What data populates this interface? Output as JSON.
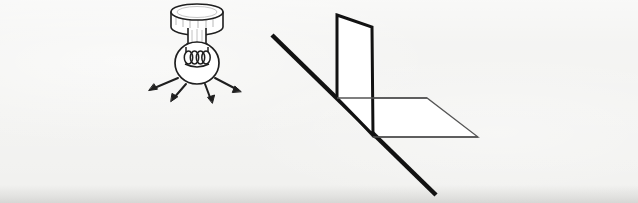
{
  "figure": {
    "title": "Light source and illuminated surfaces diagram",
    "background_color": "#f1f1ef",
    "ink_color": "#1a1a1a",
    "fill_color": "#ffffff",
    "width": 638,
    "height": 203
  },
  "lamp": {
    "label": "Ceiling-mounted light bulb emitting light rays",
    "ceiling_mount": {
      "label": "Ceiling canopy",
      "center_x": 197,
      "top_y": 12,
      "rx": 26,
      "ry": 8,
      "body_height": 15
    },
    "stem": {
      "label": "Lamp stem",
      "x": 188,
      "y": 30,
      "width": 18,
      "height": 18
    },
    "bulb": {
      "label": "Light bulb",
      "center_x": 197,
      "center_y": 63,
      "rx": 22,
      "ry": 21
    },
    "filament": {
      "label": "Coiled filament",
      "coil_count": 4,
      "center_x": 197,
      "center_y": 57
    },
    "rays": [
      {
        "name": "ray-upper-left",
        "x1": 178,
        "y1": 78,
        "x2": 150,
        "y2": 90
      },
      {
        "name": "ray-lower-left",
        "x1": 186,
        "y1": 84,
        "x2": 172,
        "y2": 101
      },
      {
        "name": "ray-lower-right",
        "x1": 205,
        "y1": 84,
        "x2": 212,
        "y2": 102
      },
      {
        "name": "ray-upper-right",
        "x1": 215,
        "y1": 78,
        "x2": 240,
        "y2": 92
      }
    ],
    "ray_count": 4
  },
  "geometry": {
    "label": "Perspective drawing of a vertical panel meeting a horizontal plane, crossed by a diagonal line",
    "wall": {
      "label": "Vertical panel",
      "points": "337,15 372,27 373,135 337,98",
      "stroke_width": 3
    },
    "floor": {
      "label": "Horizontal plane",
      "points": "337,98 427,98 478,137 373,137",
      "stroke_width": 1.3
    },
    "diagonal": {
      "label": "Thick diagonal line",
      "x1": 272,
      "y1": 35,
      "x2": 436,
      "y2": 195,
      "stroke_width": 4.5
    },
    "wall_front_edge": {
      "label": "Panel front vertical edge",
      "x1": 337,
      "y1": 15,
      "x2": 337,
      "y2": 98
    },
    "wall_back_edge": {
      "label": "Panel back vertical edge",
      "x1": 372,
      "y1": 27,
      "x2": 373,
      "y2": 135
    }
  }
}
